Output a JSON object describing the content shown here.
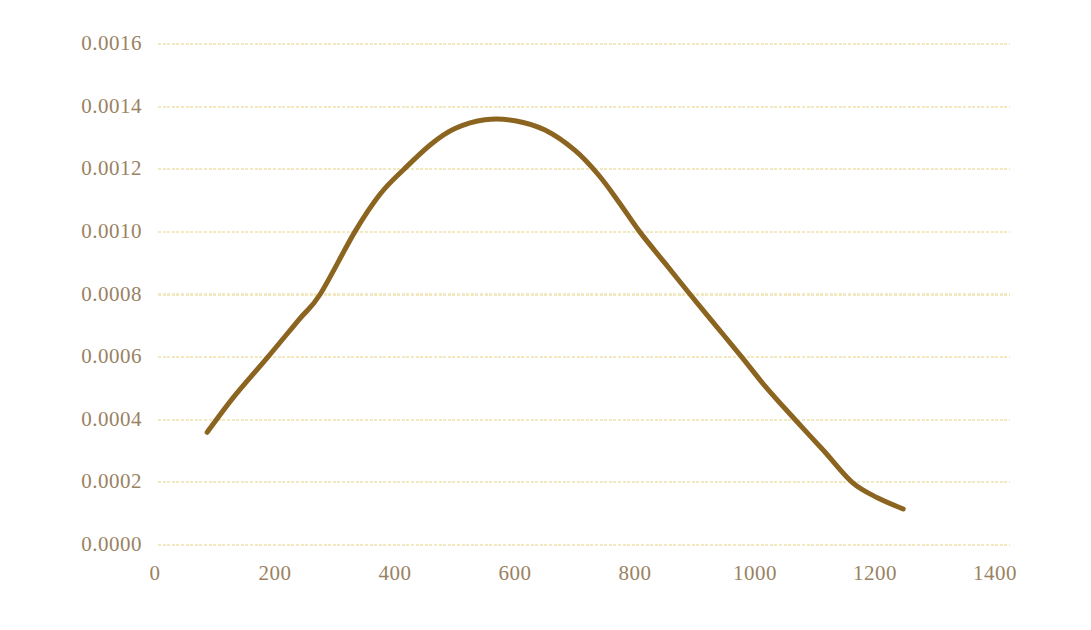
{
  "chart_data": {
    "type": "line",
    "title": "",
    "subtitle": "",
    "xlabel": "",
    "ylabel": "",
    "xlim": [
      0,
      1400
    ],
    "ylim": [
      0.0,
      0.0016
    ],
    "grid": true,
    "grid_axis": "y",
    "legend": null,
    "legend_position": "none",
    "xticks": [
      0,
      200,
      400,
      600,
      800,
      1000,
      1200,
      1400
    ],
    "xticklabels": [
      "0",
      "200",
      "400",
      "600",
      "800",
      "1000",
      "1200",
      "1400"
    ],
    "yticks": [
      0.0,
      0.0002,
      0.0004,
      0.0006,
      0.0008,
      0.001,
      0.0012,
      0.0014,
      0.0016
    ],
    "yticklabels": [
      "0.0000",
      "0.0002",
      "0.0004",
      "0.0006",
      "0.0008",
      "0.0010",
      "0.0012",
      "0.0014",
      "0.0016"
    ],
    "series": [
      {
        "name": "density",
        "color": "#8b6420",
        "linewidth": 5,
        "x": [
          87,
          130,
          188,
          240,
          275,
          333,
          375,
          415,
          460,
          500,
          550,
          600,
          650,
          700,
          740,
          775,
          808,
          850,
          892,
          935,
          978,
          1020,
          1067,
          1115,
          1162,
          1205,
          1247
        ],
        "y": [
          0.00036,
          0.00047,
          0.0006,
          0.00072,
          0.0008,
          0.001,
          0.00112,
          0.0012,
          0.00128,
          0.00133,
          0.001358,
          0.001355,
          0.001325,
          0.00126,
          0.00118,
          0.00109,
          0.001,
          0.0009,
          0.0008,
          0.0007,
          0.0006,
          0.0005,
          0.0004,
          0.0003,
          0.0002,
          0.00015,
          0.000115
        ]
      }
    ]
  },
  "style": {
    "background_color": "#ffffff",
    "line_color": "#8b6420",
    "grid_color": "#f2e9c0",
    "tick_label_color": "#9a8263"
  }
}
